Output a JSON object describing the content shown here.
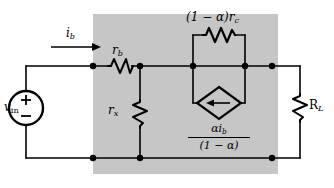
{
  "figure": {
    "type": "circuit-schematic",
    "title": "",
    "background_color": "#ffffff",
    "shaded_region_color": "#c6c6c6",
    "line_color": "#000000"
  },
  "labels": {
    "source_label": "v",
    "source_label_sub": "in",
    "source_plus": "+",
    "source_minus": "−",
    "current_label": "i",
    "current_label_sub": "b",
    "rb_label": "r",
    "rb_label_sub": "b",
    "rx_label": "r",
    "rx_label_sub": "x",
    "rc_label": "(1 − α)r",
    "rc_label_sub": "c",
    "load_label": "R",
    "load_label_sub": "L",
    "dependent_source_numerator": "αi",
    "dependent_source_numerator_sub": "b",
    "dependent_source_denominator": "(1 − α)"
  },
  "components": [
    {
      "name": "voltage-source",
      "kind": "independent-voltage-source",
      "shape": "circle",
      "label": "v_in",
      "polarity_top": "+",
      "polarity_bottom": "−"
    },
    {
      "name": "resistor-rb",
      "kind": "resistor",
      "orientation": "horizontal",
      "label": "r_b"
    },
    {
      "name": "resistor-rx",
      "kind": "resistor",
      "orientation": "vertical",
      "label": "r_x"
    },
    {
      "name": "resistor-rc",
      "kind": "resistor",
      "orientation": "horizontal",
      "label": "(1 − α)r_c"
    },
    {
      "name": "resistor-load",
      "kind": "resistor",
      "orientation": "vertical",
      "label": "R_L"
    },
    {
      "name": "dependent-current-source",
      "kind": "dependent-current-source",
      "shape": "diamond",
      "arrow_direction": "left",
      "label": "αi_b / (1 − α)"
    }
  ],
  "nodes": {
    "top_rail_dots": [
      93,
      140,
      193,
      245,
      272
    ],
    "bottom_rail_dots": [
      93,
      140,
      272
    ]
  }
}
